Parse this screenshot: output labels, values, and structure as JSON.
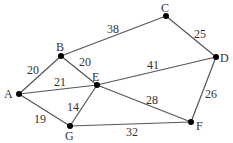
{
  "nodes": [
    {
      "id": "A",
      "x": 19,
      "y": 94,
      "lx": 4,
      "ly": 98
    },
    {
      "id": "B",
      "x": 61,
      "y": 56,
      "lx": 56,
      "ly": 51
    },
    {
      "id": "C",
      "x": 166,
      "y": 16,
      "lx": 161,
      "ly": 12
    },
    {
      "id": "D",
      "x": 216,
      "y": 57,
      "lx": 220,
      "ly": 62
    },
    {
      "id": "E",
      "x": 97,
      "y": 85,
      "lx": 92,
      "ly": 81
    },
    {
      "id": "F",
      "x": 191,
      "y": 122,
      "lx": 196,
      "ly": 130
    },
    {
      "id": "G",
      "x": 70,
      "y": 126,
      "lx": 65,
      "ly": 140
    }
  ],
  "edges": [
    {
      "from": "A",
      "to": "B",
      "weight": "20",
      "lx": 27,
      "ly": 74
    },
    {
      "from": "B",
      "to": "C",
      "weight": "38",
      "lx": 107,
      "ly": 33
    },
    {
      "from": "B",
      "to": "E",
      "weight": "20",
      "lx": 79,
      "ly": 66
    },
    {
      "from": "A",
      "to": "E",
      "weight": "21",
      "lx": 54,
      "ly": 86
    },
    {
      "from": "C",
      "to": "D",
      "weight": "25",
      "lx": 194,
      "ly": 38
    },
    {
      "from": "E",
      "to": "D",
      "weight": "41",
      "lx": 147,
      "ly": 69
    },
    {
      "from": "E",
      "to": "F",
      "weight": "28",
      "lx": 146,
      "ly": 104
    },
    {
      "from": "A",
      "to": "G",
      "weight": "19",
      "lx": 34,
      "ly": 123
    },
    {
      "from": "G",
      "to": "E",
      "weight": "14",
      "lx": 67,
      "ly": 111
    },
    {
      "from": "G",
      "to": "F",
      "weight": "32",
      "lx": 126,
      "ly": 136
    },
    {
      "from": "D",
      "to": "F",
      "weight": "26",
      "lx": 205,
      "ly": 98
    }
  ]
}
